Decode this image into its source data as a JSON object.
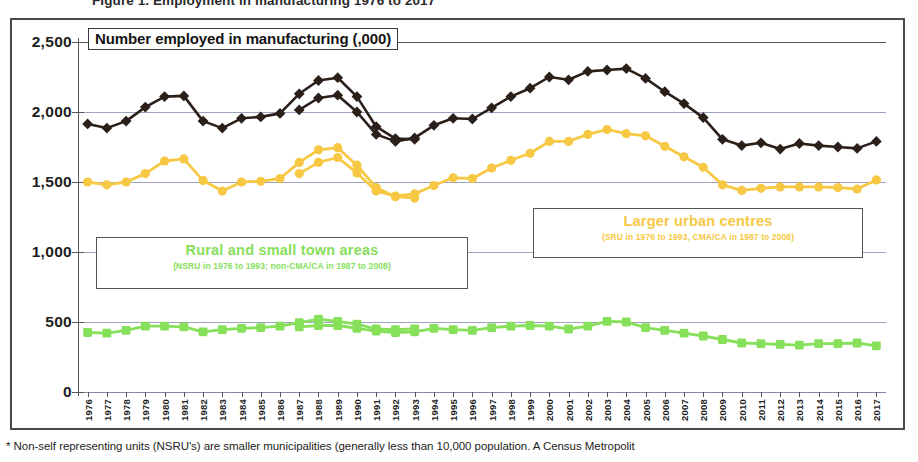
{
  "figure": {
    "top_title_clipped": "Figure 1.  Employment in manufacturing  1976 to 2017",
    "footnote": "* Non-self representing units (NSRU's) are smaller municipalities (generally less than 10,000 population. A Census Metropolit"
  },
  "chart_title_box": "Number employed in manufacturing (,000)",
  "legends": {
    "rural": {
      "title": "Rural and small town areas",
      "subtitle": "(NSRU  in 1976  to  1993;  non-CMA/CA  in 1987  to 2008)",
      "color": "#86e05a"
    },
    "urban": {
      "title": "Larger urban centres",
      "subtitle": "(SRU in 1976 to 1993,  CMA/CA in 1987 to 2008)",
      "color": "#f6c843"
    }
  },
  "chart_data": {
    "type": "line",
    "title": "Number employed in manufacturing (,000)",
    "xlabel": "",
    "ylabel": "Number employed in manufacturing (,000)",
    "ylim": [
      0,
      2500
    ],
    "yticks": [
      0,
      500,
      1000,
      1500,
      2000,
      2500
    ],
    "ytick_labels": [
      "0",
      "500",
      "1,000",
      "1,500",
      "2,000",
      "2,500"
    ],
    "grid": true,
    "legend_position": "inside-callouts",
    "x": [
      1976,
      1977,
      1978,
      1979,
      1980,
      1981,
      1982,
      1983,
      1984,
      1985,
      1986,
      1987,
      1988,
      1989,
      1990,
      1991,
      1992,
      1993,
      1994,
      1995,
      1996,
      1997,
      1998,
      1999,
      2000,
      2001,
      2002,
      2003,
      2004,
      2005,
      2006,
      2007,
      2008,
      2009,
      2010,
      2011,
      2012,
      2013,
      2014,
      2015,
      2016,
      2017
    ],
    "xtick_labels": [
      "1976",
      "1977",
      "1978",
      "1979",
      "1980",
      "1981",
      "1982",
      "1983",
      "1984",
      "1985",
      "1986",
      "1987",
      "1988",
      "1989",
      "1990",
      "1991",
      "1992",
      "1993",
      "1994",
      "1995",
      "1996",
      "1997",
      "1998",
      "1999",
      "2000",
      "2001",
      "2002",
      "2003",
      "2004",
      "2005",
      "2006",
      "2007",
      "2008",
      "2009",
      "2010",
      "2011",
      "2012",
      "2013",
      "2014",
      "2015",
      "2016",
      "2017"
    ],
    "series": [
      {
        "name": "Total manufacturing employment (dark)",
        "definition": "1976 to 1993 basis",
        "color": "#2b1f1a",
        "marker": "diamond",
        "points": [
          {
            "x": 1976,
            "y": 1915
          },
          {
            "x": 1977,
            "y": 1885
          },
          {
            "x": 1978,
            "y": 1935
          },
          {
            "x": 1979,
            "y": 2035
          },
          {
            "x": 1980,
            "y": 2110
          },
          {
            "x": 1981,
            "y": 2115
          },
          {
            "x": 1982,
            "y": 1935
          },
          {
            "x": 1983,
            "y": 1885
          },
          {
            "x": 1984,
            "y": 1955
          },
          {
            "x": 1985,
            "y": 1965
          },
          {
            "x": 1986,
            "y": 1990
          },
          {
            "x": 1987,
            "y": 2130
          },
          {
            "x": 1988,
            "y": 2225
          },
          {
            "x": 1989,
            "y": 2245
          },
          {
            "x": 1990,
            "y": 2110
          },
          {
            "x": 1991,
            "y": 1895
          },
          {
            "x": 1992,
            "y": 1810
          },
          {
            "x": 1993,
            "y": 1805
          }
        ]
      },
      {
        "name": "Total manufacturing employment (dark, new basis)",
        "definition": "1987 to 2017 basis",
        "color": "#2b1f1a",
        "marker": "diamond",
        "points": [
          {
            "x": 1987,
            "y": 2015
          },
          {
            "x": 1988,
            "y": 2100
          },
          {
            "x": 1989,
            "y": 2120
          },
          {
            "x": 1990,
            "y": 2000
          },
          {
            "x": 1991,
            "y": 1840
          },
          {
            "x": 1992,
            "y": 1790
          },
          {
            "x": 1993,
            "y": 1815
          },
          {
            "x": 1994,
            "y": 1905
          },
          {
            "x": 1995,
            "y": 1955
          },
          {
            "x": 1996,
            "y": 1950
          },
          {
            "x": 1997,
            "y": 2030
          },
          {
            "x": 1998,
            "y": 2110
          },
          {
            "x": 1999,
            "y": 2170
          },
          {
            "x": 2000,
            "y": 2250
          },
          {
            "x": 2001,
            "y": 2230
          },
          {
            "x": 2002,
            "y": 2290
          },
          {
            "x": 2003,
            "y": 2300
          },
          {
            "x": 2004,
            "y": 2310
          },
          {
            "x": 2005,
            "y": 2240
          },
          {
            "x": 2006,
            "y": 2145
          },
          {
            "x": 2007,
            "y": 2060
          },
          {
            "x": 2008,
            "y": 1960
          },
          {
            "x": 2009,
            "y": 1805
          },
          {
            "x": 2010,
            "y": 1760
          },
          {
            "x": 2011,
            "y": 1780
          },
          {
            "x": 2012,
            "y": 1735
          },
          {
            "x": 2013,
            "y": 1775
          },
          {
            "x": 2014,
            "y": 1760
          },
          {
            "x": 2015,
            "y": 1750
          },
          {
            "x": 2016,
            "y": 1740
          },
          {
            "x": 2017,
            "y": 1790
          }
        ]
      },
      {
        "name": "Larger urban centres",
        "definition": "SRU in 1976 to 1993",
        "color": "#f6c843",
        "marker": "circle",
        "points": [
          {
            "x": 1976,
            "y": 1500
          },
          {
            "x": 1977,
            "y": 1480
          },
          {
            "x": 1978,
            "y": 1500
          },
          {
            "x": 1979,
            "y": 1560
          },
          {
            "x": 1980,
            "y": 1650
          },
          {
            "x": 1981,
            "y": 1665
          },
          {
            "x": 1982,
            "y": 1510
          },
          {
            "x": 1983,
            "y": 1435
          },
          {
            "x": 1984,
            "y": 1500
          },
          {
            "x": 1985,
            "y": 1505
          },
          {
            "x": 1986,
            "y": 1525
          },
          {
            "x": 1987,
            "y": 1640
          },
          {
            "x": 1988,
            "y": 1730
          },
          {
            "x": 1989,
            "y": 1745
          },
          {
            "x": 1990,
            "y": 1620
          },
          {
            "x": 1991,
            "y": 1460
          },
          {
            "x": 1992,
            "y": 1395
          },
          {
            "x": 1993,
            "y": 1385
          }
        ]
      },
      {
        "name": "Larger urban centres",
        "definition": "CMA/CA in 1987 to 2017",
        "color": "#f6c843",
        "marker": "circle",
        "points": [
          {
            "x": 1987,
            "y": 1560
          },
          {
            "x": 1988,
            "y": 1640
          },
          {
            "x": 1989,
            "y": 1675
          },
          {
            "x": 1990,
            "y": 1565
          },
          {
            "x": 1991,
            "y": 1435
          },
          {
            "x": 1992,
            "y": 1400
          },
          {
            "x": 1993,
            "y": 1415
          },
          {
            "x": 1994,
            "y": 1475
          },
          {
            "x": 1995,
            "y": 1530
          },
          {
            "x": 1996,
            "y": 1525
          },
          {
            "x": 1997,
            "y": 1600
          },
          {
            "x": 1998,
            "y": 1655
          },
          {
            "x": 1999,
            "y": 1705
          },
          {
            "x": 2000,
            "y": 1790
          },
          {
            "x": 2001,
            "y": 1790
          },
          {
            "x": 2002,
            "y": 1840
          },
          {
            "x": 2003,
            "y": 1875
          },
          {
            "x": 2004,
            "y": 1845
          },
          {
            "x": 2005,
            "y": 1830
          },
          {
            "x": 2006,
            "y": 1755
          },
          {
            "x": 2007,
            "y": 1680
          },
          {
            "x": 2008,
            "y": 1605
          },
          {
            "x": 2009,
            "y": 1480
          },
          {
            "x": 2010,
            "y": 1440
          },
          {
            "x": 2011,
            "y": 1455
          },
          {
            "x": 2012,
            "y": 1465
          },
          {
            "x": 2013,
            "y": 1465
          },
          {
            "x": 2014,
            "y": 1465
          },
          {
            "x": 2015,
            "y": 1460
          },
          {
            "x": 2016,
            "y": 1450
          },
          {
            "x": 2017,
            "y": 1515
          }
        ]
      },
      {
        "name": "Rural and small town areas",
        "definition": "NSRU in 1976 to 1993",
        "color": "#86e05a",
        "marker": "square",
        "points": [
          {
            "x": 1976,
            "y": 425
          },
          {
            "x": 1977,
            "y": 420
          },
          {
            "x": 1978,
            "y": 440
          },
          {
            "x": 1979,
            "y": 470
          },
          {
            "x": 1980,
            "y": 470
          },
          {
            "x": 1981,
            "y": 465
          },
          {
            "x": 1982,
            "y": 430
          },
          {
            "x": 1983,
            "y": 445
          },
          {
            "x": 1984,
            "y": 455
          },
          {
            "x": 1985,
            "y": 460
          },
          {
            "x": 1986,
            "y": 470
          },
          {
            "x": 1987,
            "y": 495
          },
          {
            "x": 1988,
            "y": 520
          },
          {
            "x": 1989,
            "y": 505
          },
          {
            "x": 1990,
            "y": 485
          },
          {
            "x": 1991,
            "y": 450
          },
          {
            "x": 1992,
            "y": 445
          },
          {
            "x": 1993,
            "y": 450
          }
        ]
      },
      {
        "name": "Rural and small town areas",
        "definition": "non-CMA/CA in 1987 to 2017",
        "color": "#86e05a",
        "marker": "square",
        "points": [
          {
            "x": 1987,
            "y": 465
          },
          {
            "x": 1988,
            "y": 475
          },
          {
            "x": 1989,
            "y": 475
          },
          {
            "x": 1990,
            "y": 455
          },
          {
            "x": 1991,
            "y": 435
          },
          {
            "x": 1992,
            "y": 425
          },
          {
            "x": 1993,
            "y": 430
          },
          {
            "x": 1994,
            "y": 455
          },
          {
            "x": 1995,
            "y": 445
          },
          {
            "x": 1996,
            "y": 440
          },
          {
            "x": 1997,
            "y": 460
          },
          {
            "x": 1998,
            "y": 470
          },
          {
            "x": 1999,
            "y": 475
          },
          {
            "x": 2000,
            "y": 470
          },
          {
            "x": 2001,
            "y": 450
          },
          {
            "x": 2002,
            "y": 470
          },
          {
            "x": 2003,
            "y": 505
          },
          {
            "x": 2004,
            "y": 500
          },
          {
            "x": 2005,
            "y": 460
          },
          {
            "x": 2006,
            "y": 440
          },
          {
            "x": 2007,
            "y": 420
          },
          {
            "x": 2008,
            "y": 400
          },
          {
            "x": 2009,
            "y": 375
          },
          {
            "x": 2010,
            "y": 350
          },
          {
            "x": 2011,
            "y": 345
          },
          {
            "x": 2012,
            "y": 340
          },
          {
            "x": 2013,
            "y": 335
          },
          {
            "x": 2014,
            "y": 345
          },
          {
            "x": 2015,
            "y": 345
          },
          {
            "x": 2016,
            "y": 350
          },
          {
            "x": 2017,
            "y": 330
          }
        ]
      }
    ]
  }
}
